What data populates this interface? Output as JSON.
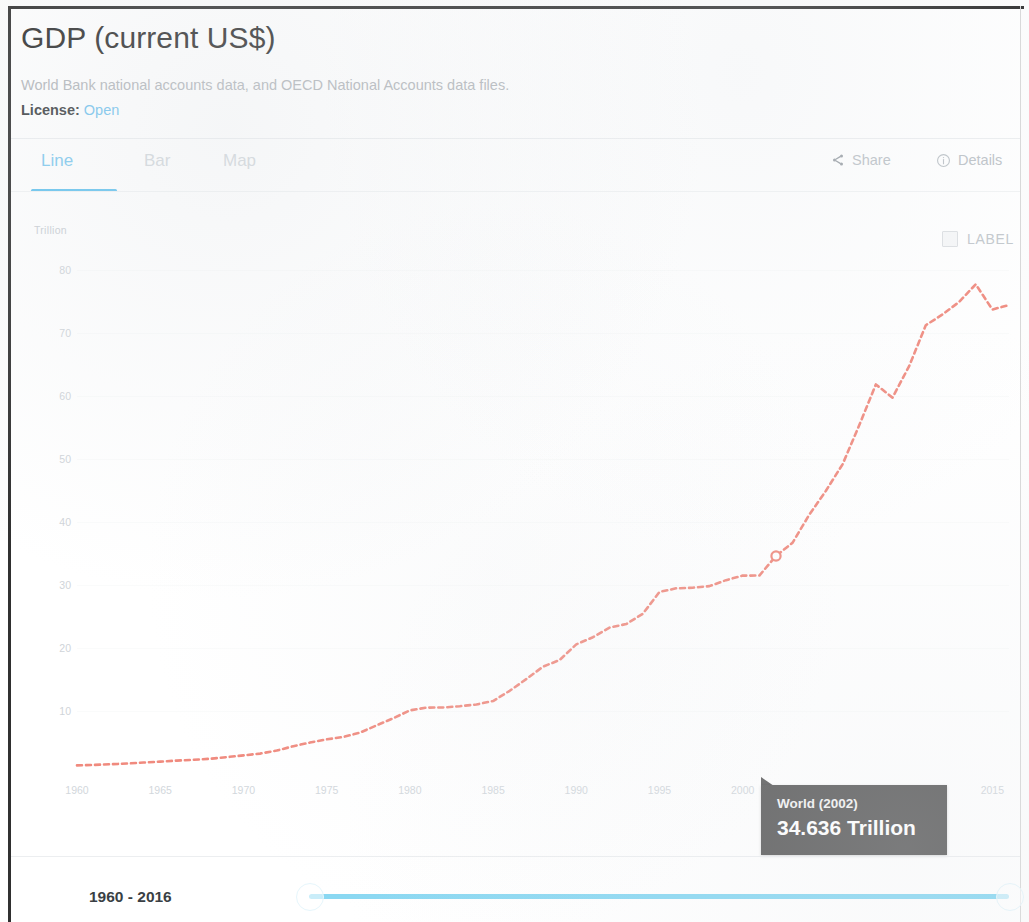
{
  "header": {
    "title": "GDP (current US$)",
    "source": "World Bank national accounts data, and OECD National Accounts data files.",
    "license_label": "License:",
    "license_value": "Open"
  },
  "tabs": [
    {
      "label": "Line",
      "active": true
    },
    {
      "label": "Bar",
      "active": false
    },
    {
      "label": "Map",
      "active": false
    }
  ],
  "toolbar": {
    "share_label": "Share",
    "details_label": "Details"
  },
  "label_toggle": {
    "label": "LABEL",
    "checked": false
  },
  "tooltip": {
    "title": "World (2002)",
    "value": "34.636 Trillion"
  },
  "range": {
    "label": "1960 - 2016",
    "start": 1960,
    "end": 2016
  },
  "colors": {
    "accent": "#63c3ef",
    "line": "#f08a7e",
    "tooltip_bg": "#5d5d5d",
    "slider": "#8ad8f2",
    "title": "#2c2c2c",
    "muted": "#c9ced3"
  },
  "chart_data": {
    "type": "line",
    "title": "GDP (current US$)",
    "xlabel": "",
    "ylabel": "Trillion",
    "unit": "Trillion",
    "series_name": "World",
    "grid": true,
    "legend": "none",
    "xlim": [
      1960,
      2016
    ],
    "ylim": [
      0,
      85
    ],
    "ytick_labels": [
      "80",
      "70",
      "60",
      "50",
      "40",
      "30",
      "20",
      "10"
    ],
    "ytick_values": [
      80,
      70,
      60,
      50,
      40,
      30,
      20,
      10
    ],
    "xtick_labels": [
      "1960",
      "1965",
      "1970",
      "1975",
      "1980",
      "1985",
      "1990",
      "1995",
      "2000",
      "2005",
      "2010",
      "2015"
    ],
    "xtick_values": [
      1960,
      1965,
      1970,
      1975,
      1980,
      1985,
      1990,
      1995,
      2000,
      2005,
      2010,
      2015
    ],
    "highlight": {
      "x": 2002,
      "y": 34.636,
      "label": "World (2002)",
      "value_label": "34.636 Trillion"
    },
    "x": [
      1960,
      1961,
      1962,
      1963,
      1964,
      1965,
      1966,
      1967,
      1968,
      1969,
      1970,
      1971,
      1972,
      1973,
      1974,
      1975,
      1976,
      1977,
      1978,
      1979,
      1980,
      1981,
      1982,
      1983,
      1984,
      1985,
      1986,
      1987,
      1988,
      1989,
      1990,
      1991,
      1992,
      1993,
      1994,
      1995,
      1996,
      1997,
      1998,
      1999,
      2000,
      2001,
      2002,
      2003,
      2004,
      2005,
      2006,
      2007,
      2008,
      2009,
      2010,
      2011,
      2012,
      2013,
      2014,
      2015,
      2016
    ],
    "values": [
      1.37,
      1.44,
      1.55,
      1.66,
      1.82,
      1.97,
      2.13,
      2.26,
      2.42,
      2.68,
      2.96,
      3.24,
      3.72,
      4.42,
      5.0,
      5.5,
      5.88,
      6.56,
      7.73,
      8.86,
      10.1,
      10.55,
      10.56,
      10.77,
      11.05,
      11.59,
      13.22,
      15.09,
      17.05,
      18.11,
      20.6,
      21.73,
      23.27,
      23.82,
      25.46,
      28.93,
      29.5,
      29.6,
      29.85,
      30.8,
      31.52,
      31.53,
      34.64,
      36.76,
      41.2,
      45.0,
      49.2,
      55.4,
      61.89,
      59.8,
      64.8,
      71.3,
      73.0,
      75.0,
      77.8,
      73.8,
      74.5
    ]
  }
}
